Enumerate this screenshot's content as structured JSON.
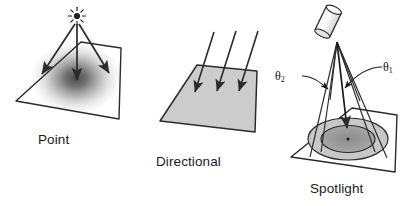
{
  "figure": {
    "background_color": "#ffffff",
    "width": 409,
    "height": 206
  },
  "panels": [
    {
      "id": "point",
      "caption": "Point",
      "description": "Point light source above a plane with radial falloff",
      "source_icon": "star-burst-icon",
      "plane_fill": "radial-gradient-gray",
      "ray_count": 3
    },
    {
      "id": "directional",
      "caption": "Directional",
      "description": "Parallel light rays striking a uniformly lit plane",
      "source_icon": "parallel-rays-icon",
      "plane_fill": "#cccccc",
      "ray_count": 3
    },
    {
      "id": "spotlight",
      "caption": "Spotlight",
      "description": "Cone-shaped spotlight from a tilted lamp onto concentric ellipses",
      "source_icon": "lamp-cylinder-icon",
      "plane_fill": "#ffffff",
      "inner_cone_fill": "#9a9a9a",
      "outer_cone_fill": "#c8c8c8",
      "ray_count": 6,
      "angle_labels": [
        {
          "id": "theta1",
          "symbol": "θ",
          "subscript": "1"
        },
        {
          "id": "theta2",
          "symbol": "θ",
          "subscript": "2"
        }
      ]
    }
  ],
  "colors": {
    "stroke": "#2b2b2b",
    "plane_gray": "#cccccc",
    "cone_inner": "#9a9a9a",
    "cone_outer": "#c8c8c8",
    "text": "#1a1a1a"
  }
}
